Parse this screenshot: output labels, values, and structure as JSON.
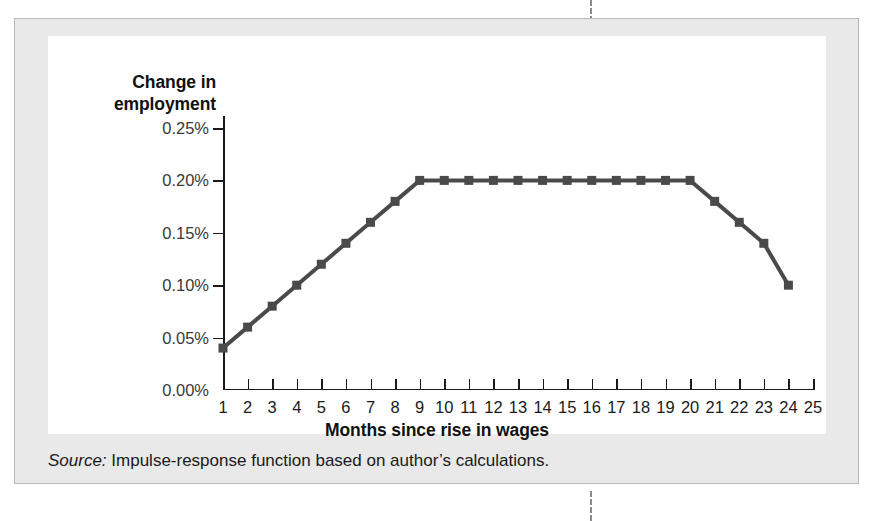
{
  "figure": {
    "y_axis_title_line1": "Change in",
    "y_axis_title_line2": "employment",
    "x_axis_title": "Months since rise in wages",
    "source_label": "Source:",
    "source_text": " Impulse-response function based on author’s calculations."
  },
  "style": {
    "series_color": "#4a4a4a",
    "axis_color": "#1a1a1a",
    "panel_bg": "#e9e9e9",
    "plot_bg": "#ffffff"
  },
  "chart_data": {
    "type": "line",
    "title": "",
    "xlabel": "Months since rise in wages",
    "ylabel": "Change in employment",
    "xlim": [
      1,
      25
    ],
    "ylim": [
      0.0,
      0.25
    ],
    "grid": false,
    "legend": "none",
    "marker": "square",
    "ytick_labels": [
      "0.00%",
      "0.05%",
      "0.10%",
      "0.15%",
      "0.20%",
      "0.25%"
    ],
    "ytick_values": [
      0.0,
      0.05,
      0.1,
      0.15,
      0.2,
      0.25
    ],
    "xtick_labels": [
      "1",
      "2",
      "3",
      "4",
      "5",
      "6",
      "7",
      "8",
      "9",
      "10",
      "11",
      "12",
      "13",
      "14",
      "15",
      "16",
      "17",
      "18",
      "19",
      "20",
      "21",
      "22",
      "23",
      "24",
      "25"
    ],
    "x": [
      1,
      2,
      3,
      4,
      5,
      6,
      7,
      8,
      9,
      10,
      11,
      12,
      13,
      14,
      15,
      16,
      17,
      18,
      19,
      20,
      21,
      22,
      23,
      24
    ],
    "values": [
      0.04,
      0.06,
      0.08,
      0.1,
      0.12,
      0.14,
      0.16,
      0.18,
      0.2,
      0.2,
      0.2,
      0.2,
      0.2,
      0.2,
      0.2,
      0.2,
      0.2,
      0.2,
      0.2,
      0.2,
      0.18,
      0.16,
      0.14,
      0.1
    ]
  }
}
